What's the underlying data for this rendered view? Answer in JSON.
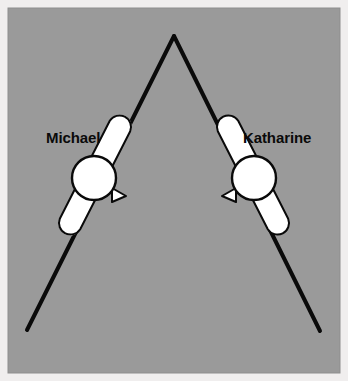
{
  "figure": {
    "background_color": "#9a9a9a",
    "frame_color": "#eceaea",
    "line_color": "#0a0a0a",
    "body_fill": "#ffffff",
    "body_stroke": "#0a0a0a",
    "canvas": {
      "width": 348,
      "height": 381
    },
    "panel": {
      "x": 8,
      "y": 8,
      "width": 332,
      "height": 365
    }
  },
  "chevron": {
    "name": "inverted-v-path",
    "apex": {
      "x": 174,
      "y": 36
    },
    "left_end": {
      "x": 27,
      "y": 330
    },
    "right_end": {
      "x": 320,
      "y": 331
    },
    "stroke_width": 4
  },
  "subjects": [
    {
      "id": "michael",
      "label": "Michael",
      "side": "left",
      "label_position": {
        "x": 46,
        "y": 143
      },
      "head": {
        "cx": 94,
        "cy": 178,
        "r": 22
      },
      "body_capsule": {
        "start": {
          "x": 120,
          "y": 126
        },
        "end": {
          "x": 70,
          "y": 224
        },
        "width": 23
      },
      "beak": {
        "x": 116,
        "y": 196,
        "direction": "right"
      }
    },
    {
      "id": "katharine",
      "label": "Katharine",
      "side": "right",
      "label_position": {
        "x": 243,
        "y": 143
      },
      "head": {
        "cx": 254,
        "cy": 178,
        "r": 22
      },
      "body_capsule": {
        "start": {
          "x": 228,
          "y": 126
        },
        "end": {
          "x": 278,
          "y": 224
        },
        "width": 23
      },
      "beak": {
        "x": 232,
        "y": 196,
        "direction": "left"
      }
    }
  ]
}
